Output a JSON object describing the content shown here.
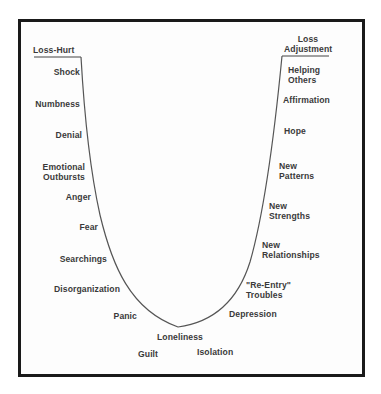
{
  "diagram": {
    "type": "grief-curve",
    "start_label": "Loss-Hurt",
    "end_label": [
      "Loss",
      "Adjustment"
    ],
    "left_stages": [
      {
        "lines": [
          "Shock"
        ]
      },
      {
        "lines": [
          "Numbness"
        ]
      },
      {
        "lines": [
          "Denial"
        ]
      },
      {
        "lines": [
          "Emotional",
          "Outbursts"
        ]
      },
      {
        "lines": [
          "Anger"
        ]
      },
      {
        "lines": [
          "Fear"
        ]
      },
      {
        "lines": [
          "Searchings"
        ]
      },
      {
        "lines": [
          "Disorganization"
        ]
      },
      {
        "lines": [
          "Panic"
        ]
      }
    ],
    "bottom_stages": [
      {
        "lines": [
          "Loneliness"
        ]
      },
      {
        "lines": [
          "Guilt"
        ]
      },
      {
        "lines": [
          "Isolation"
        ]
      }
    ],
    "right_stages": [
      {
        "lines": [
          "Depression"
        ]
      },
      {
        "lines": [
          "\"Re-Entry\"",
          "Troubles"
        ]
      },
      {
        "lines": [
          "New",
          "Relationships"
        ]
      },
      {
        "lines": [
          "New",
          "Strengths"
        ]
      },
      {
        "lines": [
          "New",
          "Patterns"
        ]
      },
      {
        "lines": [
          "Hope"
        ]
      },
      {
        "lines": [
          "Affirmation"
        ]
      },
      {
        "lines": [
          "Helping",
          "Others"
        ]
      }
    ],
    "colors": {
      "frame": "#1a1a1a",
      "curve": "#555555",
      "text": "#3a3a3a"
    }
  }
}
